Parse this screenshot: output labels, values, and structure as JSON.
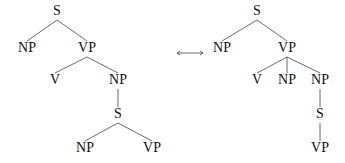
{
  "arrow": {
    "symbol": "⟷",
    "x1": 177,
    "x2": 203,
    "y": 53
  },
  "trees": [
    {
      "name": "left-tree",
      "nodes": [
        {
          "id": "S1",
          "label": "S",
          "x": 57,
          "y": 15
        },
        {
          "id": "NP1",
          "label": "NP",
          "x": 27,
          "y": 52
        },
        {
          "id": "VP1",
          "label": "VP",
          "x": 87,
          "y": 52
        },
        {
          "id": "V1",
          "label": "V",
          "x": 55,
          "y": 84
        },
        {
          "id": "NP2",
          "label": "NP",
          "x": 118,
          "y": 84
        },
        {
          "id": "S2",
          "label": "S",
          "x": 118,
          "y": 118
        },
        {
          "id": "NP3",
          "label": "NP",
          "x": 85,
          "y": 152
        },
        {
          "id": "VP2",
          "label": "VP",
          "x": 152,
          "y": 152
        }
      ],
      "edges": [
        [
          "S1",
          "NP1"
        ],
        [
          "S1",
          "VP1"
        ],
        [
          "VP1",
          "V1"
        ],
        [
          "VP1",
          "NP2"
        ],
        [
          "NP2",
          "S2"
        ],
        [
          "S2",
          "NP3"
        ],
        [
          "S2",
          "VP2"
        ]
      ]
    },
    {
      "name": "right-tree",
      "nodes": [
        {
          "id": "S1",
          "label": "S",
          "x": 257,
          "y": 15
        },
        {
          "id": "NP1",
          "label": "NP",
          "x": 222,
          "y": 52
        },
        {
          "id": "VP1",
          "label": "VP",
          "x": 287,
          "y": 52
        },
        {
          "id": "V1",
          "label": "V",
          "x": 257,
          "y": 84
        },
        {
          "id": "NP2",
          "label": "NP",
          "x": 287,
          "y": 84
        },
        {
          "id": "NP3",
          "label": "NP",
          "x": 320,
          "y": 84
        },
        {
          "id": "S2",
          "label": "S",
          "x": 320,
          "y": 118
        },
        {
          "id": "VP2",
          "label": "VP",
          "x": 320,
          "y": 152
        }
      ],
      "edges": [
        [
          "S1",
          "NP1"
        ],
        [
          "S1",
          "VP1"
        ],
        [
          "VP1",
          "V1"
        ],
        [
          "VP1",
          "NP2"
        ],
        [
          "VP1",
          "NP3"
        ],
        [
          "NP3",
          "S2"
        ],
        [
          "S2",
          "VP2"
        ]
      ]
    }
  ]
}
